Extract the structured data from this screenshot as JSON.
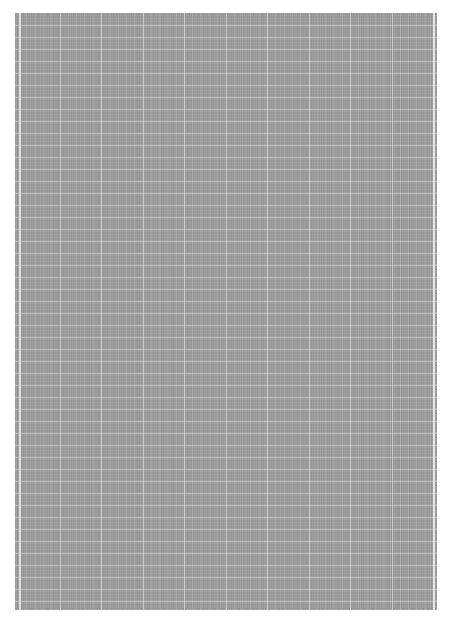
{
  "document": {
    "type": "graph-paper-scan",
    "background_color": "#9c9c9c",
    "grid_line_color": "#e0e0e0",
    "horizontal_line_spacing_px": 12,
    "vertical_major_line_spacing_px": 41,
    "text_content": ""
  }
}
